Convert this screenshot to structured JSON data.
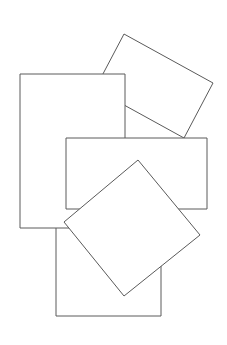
{
  "canvas": {
    "width": 227,
    "height": 345,
    "background": "#ffffff",
    "stroke": "#5a5a5a"
  },
  "shapes": [
    {
      "name": "rotated-rectangle-top",
      "points": "124,34 213,83 184,138 95,89"
    },
    {
      "name": "rectangle-bottom",
      "points": "56,222 161,222 161,316 56,316"
    },
    {
      "name": "rectangle-tall",
      "points": "20,74 125,74 125,228 20,228"
    },
    {
      "name": "rectangle-wide",
      "points": "66,138 207,138 207,209 66,209"
    },
    {
      "name": "diamond",
      "points": "138,160 200,235 124,296 64,222"
    }
  ]
}
